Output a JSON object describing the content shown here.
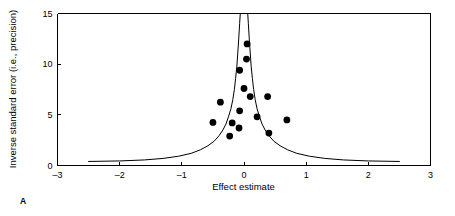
{
  "figure": {
    "panel_label": "A",
    "caption": ""
  },
  "chart_data": {
    "type": "scatter",
    "title": "",
    "subtitle": "",
    "xlabel": "Effect estimate",
    "ylabel": "Inverse standard error (i.e., precision)",
    "xlim": [
      -3,
      3
    ],
    "ylim": [
      0,
      15
    ],
    "xticks": [
      -3,
      -2,
      -1,
      0,
      1,
      2,
      3
    ],
    "xtick_labels": [
      "–3",
      "–2",
      "–1",
      "0",
      "1",
      "2",
      "3"
    ],
    "yticks": [
      0,
      5,
      10,
      15
    ],
    "ytick_labels": [
      "0",
      "5",
      "10",
      "15"
    ],
    "grid": false,
    "legend": null,
    "legend_position": "none",
    "point_color": "#000000",
    "point_radius_px": 3.4,
    "line_color": "#000000",
    "series": [
      {
        "name": "Studies",
        "marker": "filled-circle",
        "points": [
          {
            "x": 0.05,
            "y": 12.0
          },
          {
            "x": 0.04,
            "y": 10.5
          },
          {
            "x": -0.07,
            "y": 9.4
          },
          {
            "x": 0.0,
            "y": 7.6
          },
          {
            "x": 0.1,
            "y": 6.8
          },
          {
            "x": 0.38,
            "y": 6.8
          },
          {
            "x": -0.38,
            "y": 6.25
          },
          {
            "x": -0.07,
            "y": 5.4
          },
          {
            "x": 0.21,
            "y": 4.8
          },
          {
            "x": 0.69,
            "y": 4.5
          },
          {
            "x": -0.5,
            "y": 4.25
          },
          {
            "x": -0.19,
            "y": 4.2
          },
          {
            "x": -0.08,
            "y": 3.7
          },
          {
            "x": 0.4,
            "y": 3.2
          },
          {
            "x": -0.23,
            "y": 2.9
          }
        ]
      }
    ],
    "funnel": {
      "description": "Pseudo 95% confidence funnel: two symmetric curves meeting at apex near the top of the plot",
      "apex_x": -0.02,
      "apex_y": 15,
      "tail_x_left": -2.5,
      "tail_x_right": 2.5,
      "tail_y": 0.4,
      "left_curve": [
        {
          "x": -2.5,
          "y": 0.4
        },
        {
          "x": -2.0,
          "y": 0.45
        },
        {
          "x": -1.6,
          "y": 0.55
        },
        {
          "x": -1.3,
          "y": 0.7
        },
        {
          "x": -1.05,
          "y": 0.92
        },
        {
          "x": -0.85,
          "y": 1.2
        },
        {
          "x": -0.7,
          "y": 1.55
        },
        {
          "x": -0.58,
          "y": 1.95
        },
        {
          "x": -0.48,
          "y": 2.4
        },
        {
          "x": -0.4,
          "y": 2.95
        },
        {
          "x": -0.34,
          "y": 3.5
        },
        {
          "x": -0.29,
          "y": 4.1
        },
        {
          "x": -0.25,
          "y": 4.8
        },
        {
          "x": -0.21,
          "y": 5.6
        },
        {
          "x": -0.18,
          "y": 6.5
        },
        {
          "x": -0.155,
          "y": 7.5
        },
        {
          "x": -0.135,
          "y": 8.6
        },
        {
          "x": -0.115,
          "y": 9.8
        },
        {
          "x": -0.1,
          "y": 11.1
        },
        {
          "x": -0.085,
          "y": 12.5
        },
        {
          "x": -0.07,
          "y": 14.0
        },
        {
          "x": -0.06,
          "y": 15.0
        }
      ],
      "right_curve": [
        {
          "x": 2.5,
          "y": 0.4
        },
        {
          "x": 2.0,
          "y": 0.45
        },
        {
          "x": 1.6,
          "y": 0.55
        },
        {
          "x": 1.3,
          "y": 0.7
        },
        {
          "x": 1.05,
          "y": 0.92
        },
        {
          "x": 0.85,
          "y": 1.2
        },
        {
          "x": 0.7,
          "y": 1.55
        },
        {
          "x": 0.58,
          "y": 1.95
        },
        {
          "x": 0.48,
          "y": 2.4
        },
        {
          "x": 0.4,
          "y": 2.95
        },
        {
          "x": 0.34,
          "y": 3.5
        },
        {
          "x": 0.29,
          "y": 4.1
        },
        {
          "x": 0.25,
          "y": 4.8
        },
        {
          "x": 0.21,
          "y": 5.6
        },
        {
          "x": 0.18,
          "y": 6.5
        },
        {
          "x": 0.155,
          "y": 7.5
        },
        {
          "x": 0.135,
          "y": 8.6
        },
        {
          "x": 0.115,
          "y": 9.8
        },
        {
          "x": 0.1,
          "y": 11.1
        },
        {
          "x": 0.085,
          "y": 12.5
        },
        {
          "x": 0.07,
          "y": 14.0
        },
        {
          "x": 0.06,
          "y": 15.0
        }
      ]
    }
  }
}
